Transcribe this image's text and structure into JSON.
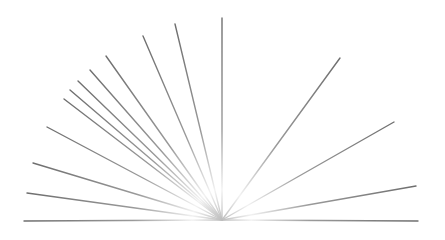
{
  "diagram": {
    "type": "radial-line-fan",
    "background": "#ffffff",
    "origin": {
      "x": 222,
      "y": 220
    },
    "stroke": {
      "tip_color": "#6e6e6e",
      "center_color": "#f2f2f2",
      "width": 1.4
    },
    "rays": [
      {
        "x": 24,
        "y": 221
      },
      {
        "x": 27,
        "y": 193
      },
      {
        "x": 33,
        "y": 163
      },
      {
        "x": 47,
        "y": 127
      },
      {
        "x": 64,
        "y": 99
      },
      {
        "x": 70,
        "y": 90
      },
      {
        "x": 78,
        "y": 81
      },
      {
        "x": 90,
        "y": 70
      },
      {
        "x": 106,
        "y": 56
      },
      {
        "x": 143,
        "y": 36
      },
      {
        "x": 175,
        "y": 24
      },
      {
        "x": 222,
        "y": 18
      },
      {
        "x": 340,
        "y": 58
      },
      {
        "x": 394,
        "y": 122
      },
      {
        "x": 416,
        "y": 186
      },
      {
        "x": 418,
        "y": 221
      }
    ]
  }
}
